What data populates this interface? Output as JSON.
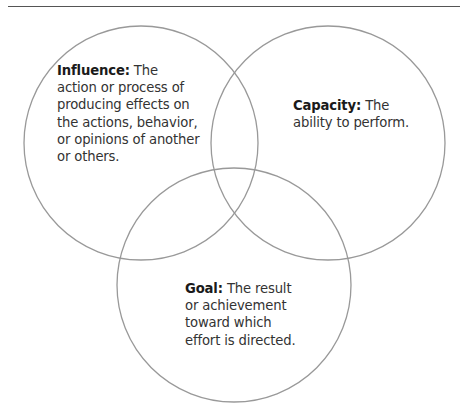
{
  "diagram": {
    "type": "venn",
    "stroke_color": "#999999",
    "rule_color": "#555555",
    "circles": [
      {
        "id": "influence",
        "cx": 141,
        "cy": 143,
        "r": 117,
        "term": "Influence:",
        "lines": [
          "The",
          "action or process of",
          "producing effects on",
          "the actions, behavior,",
          "or opinions of another",
          "or others."
        ]
      },
      {
        "id": "capacity",
        "cx": 328,
        "cy": 143,
        "r": 117,
        "term": "Capacity:",
        "lines": [
          "The",
          "ability to perform."
        ]
      },
      {
        "id": "goal",
        "cx": 234,
        "cy": 285,
        "r": 117,
        "term": "Goal:",
        "lines": [
          "The result",
          "or achievement",
          "toward which",
          "effort is directed."
        ]
      }
    ]
  }
}
